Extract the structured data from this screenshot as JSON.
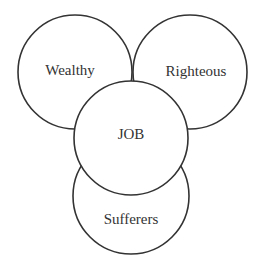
{
  "diagram": {
    "type": "overlapping-circles",
    "circles": [
      {
        "id": "wealthy",
        "label": "Wealthy"
      },
      {
        "id": "righteous",
        "label": "Righteous"
      },
      {
        "id": "sufferers",
        "label": "Sufferers"
      },
      {
        "id": "job",
        "label": "JOB"
      }
    ],
    "colors": {
      "stroke": "#333333",
      "fill": "#ffffff",
      "text": "#333333"
    }
  }
}
